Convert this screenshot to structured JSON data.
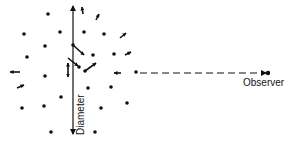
{
  "diagram": {
    "type": "particle-scattering-schematic",
    "colors": {
      "ink": "#111111",
      "background": "#ffffff"
    },
    "labels": {
      "observer": "Observer",
      "diameter": "Diameter"
    },
    "diameter_axis": {
      "x": 73,
      "y_top": 6,
      "y_bottom": 134,
      "arrowheads": [
        "up",
        "down"
      ]
    },
    "line_of_sight": {
      "from": [
        140,
        73
      ],
      "to": [
        266,
        73
      ],
      "style": "dashed",
      "arrowhead": "right"
    },
    "observer": {
      "x": 268,
      "y": 73
    },
    "dots": [
      [
        48,
        14
      ],
      [
        24,
        34
      ],
      [
        60,
        32
      ],
      [
        84,
        32
      ],
      [
        104,
        34
      ],
      [
        45,
        46
      ],
      [
        27,
        57
      ],
      [
        93,
        55
      ],
      [
        114,
        54
      ],
      [
        45,
        76
      ],
      [
        61,
        97
      ],
      [
        22,
        108
      ],
      [
        44,
        106
      ],
      [
        51,
        132
      ],
      [
        88,
        88
      ],
      [
        111,
        87
      ],
      [
        101,
        108
      ],
      [
        127,
        103
      ],
      [
        95,
        132
      ],
      [
        136,
        72
      ],
      [
        79,
        67
      ],
      [
        85,
        71
      ],
      [
        73,
        45
      ]
    ],
    "arrows": [
      {
        "from": [
          83,
          14
        ],
        "to": [
          82,
          7
        ]
      },
      {
        "from": [
          96,
          20
        ],
        "to": [
          99,
          14
        ]
      },
      {
        "from": [
          120,
          38
        ],
        "to": [
          126,
          33
        ]
      },
      {
        "from": [
          125,
          55
        ],
        "to": [
          131,
          52
        ]
      },
      {
        "from": [
          73,
          45
        ],
        "to": [
          84,
          55
        ]
      },
      {
        "from": [
          68,
          58
        ],
        "to": [
          78,
          66
        ]
      },
      {
        "from": [
          85,
          71
        ],
        "to": [
          96,
          63
        ]
      },
      {
        "from": [
          121,
          73
        ],
        "to": [
          114,
          73
        ]
      },
      {
        "from": [
          20,
          72
        ],
        "to": [
          10,
          72
        ]
      },
      {
        "from": [
          17,
          88
        ],
        "to": [
          24,
          85
        ]
      },
      {
        "from": [
          68,
          70
        ],
        "to": [
          68,
          63
        ]
      },
      {
        "from": [
          68,
          70
        ],
        "to": [
          68,
          77
        ]
      }
    ]
  }
}
